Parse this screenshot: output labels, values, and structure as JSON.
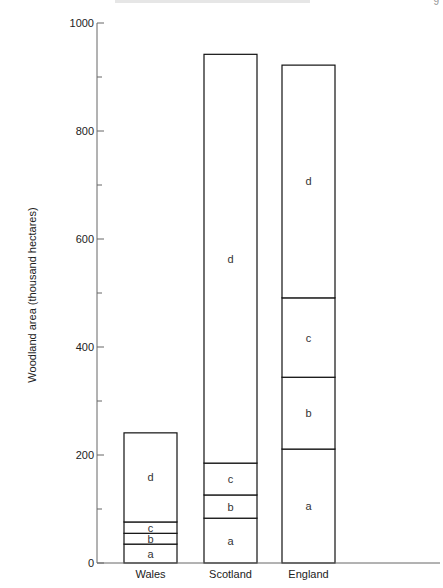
{
  "page": {
    "corner_mark": "9"
  },
  "chart_data": {
    "type": "bar",
    "stacked": true,
    "title": "",
    "xlabel": "",
    "ylabel": "Woodland area (thousand hectares)",
    "ylim": [
      0,
      1000
    ],
    "yticks": [
      0,
      200,
      400,
      600,
      800,
      1000
    ],
    "minor_yticks": [
      100,
      300,
      500,
      700,
      900
    ],
    "grid": false,
    "legend": null,
    "categories": [
      "Wales",
      "Scotland",
      "England"
    ],
    "series": [
      {
        "name": "a",
        "values": [
          35,
          83,
          211
        ]
      },
      {
        "name": "b",
        "values": [
          20,
          43,
          133
        ]
      },
      {
        "name": "c",
        "values": [
          21,
          59,
          147
        ]
      },
      {
        "name": "d",
        "values": [
          165,
          757,
          431
        ]
      }
    ],
    "totals": [
      241,
      942,
      922
    ]
  }
}
